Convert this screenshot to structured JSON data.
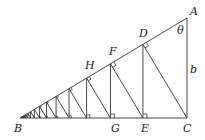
{
  "diagram": {
    "type": "geometry",
    "stroke_color": "#333333",
    "points": {
      "A": {
        "label": "A",
        "x": 187,
        "y": 18
      },
      "B": {
        "label": "B",
        "x": 20,
        "y": 118
      },
      "C": {
        "label": "C",
        "x": 187,
        "y": 118
      },
      "D": {
        "label": "D"
      },
      "E": {
        "label": "E"
      },
      "F": {
        "label": "F"
      },
      "G": {
        "label": "G"
      },
      "H": {
        "label": "H"
      }
    },
    "angle_label": "θ",
    "side_label": "b",
    "ratio": 0.75,
    "iterations": 16
  }
}
